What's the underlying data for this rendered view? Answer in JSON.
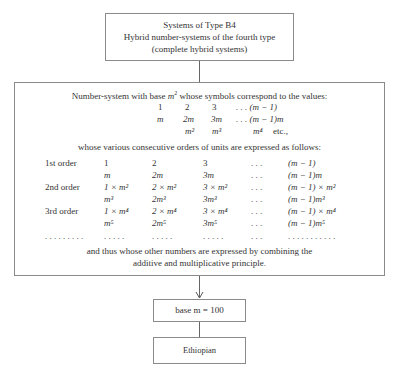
{
  "top_box": {
    "line1": "Systems of Type B4",
    "line2": "Hybrid number-systems of the fourth type",
    "line3": "(complete hybrid systems)"
  },
  "main_box": {
    "intro_prefix": "Number-system with base ",
    "intro_base": "m",
    "intro_base_exp": "2",
    "intro_suffix": " whose symbols correspond to the values:",
    "symbols": {
      "row1": [
        "1",
        "2",
        "3",
        ". . . (m − 1)"
      ],
      "row2": [
        "m",
        "2m",
        "3m",
        ". . . (m − 1)m"
      ],
      "row3": [
        "m²",
        "m³",
        "m⁴",
        "etc.,"
      ]
    },
    "orders_intro": "whose various consecutive orders of units are expressed as follows:",
    "orders": [
      {
        "label": "1st order",
        "cells": [
          "1",
          "2",
          "3",
          ". . .",
          "(m − 1)"
        ]
      },
      {
        "label": "",
        "cells": [
          "m",
          "2m",
          "3m",
          ". . .",
          "(m − 1)m"
        ]
      },
      {
        "label": "2nd order",
        "cells": [
          "1 × m²",
          "2 × m²",
          "3 × m²",
          ". . .",
          "(m − 1) × m²"
        ]
      },
      {
        "label": "",
        "cells": [
          "m³",
          "2m³",
          "3m³",
          ". . .",
          "(m − 1)m³"
        ]
      },
      {
        "label": "3rd order",
        "cells": [
          "1 × m⁴",
          "2 × m⁴",
          "3 × m⁴",
          ". . .",
          "(m − 1) × m⁴"
        ]
      },
      {
        "label": "",
        "cells": [
          "m⁵",
          "2m⁵",
          "3m⁵",
          ". . .",
          "(m − 1)m⁵"
        ]
      },
      {
        "label": ". . . . . . . . .",
        "cells": [
          ". . . . .",
          ". . . . .",
          ". . . . .",
          ". . .",
          ". . . . . . . . . . ."
        ]
      }
    ],
    "closing_line1": "and thus whose other numbers are expressed by combining the",
    "closing_line2": "additive and multiplicative principle."
  },
  "base_box": {
    "label": "base m = 100"
  },
  "result_box": {
    "label": "Ethiopian"
  }
}
